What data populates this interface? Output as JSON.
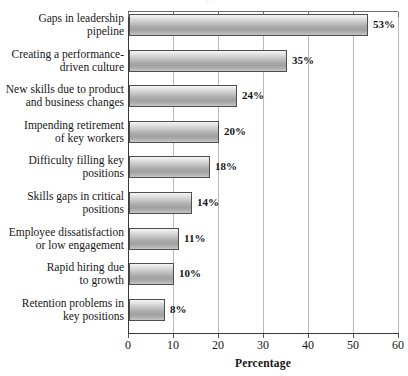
{
  "chart_data": {
    "type": "bar",
    "orientation": "horizontal",
    "title": "",
    "xlabel": "Percentage",
    "ylabel": "",
    "xlim": [
      0,
      60
    ],
    "xticks": [
      0,
      10,
      20,
      30,
      40,
      50,
      60
    ],
    "grid": true,
    "legend": null,
    "value_label_suffix": "%",
    "categories": [
      "Gaps in leadership pipeline",
      "Creating a performance-driven culture",
      "New skills due to product and business changes",
      "Impending retirement of key workers",
      "Difficulty filling key positions",
      "Skills gaps in critical positions",
      "Employee dissatisfaction or low engagement",
      "Rapid hiring due to growth",
      "Retention problems in key positions"
    ],
    "category_lines": [
      [
        "Gaps in leadership",
        "pipeline"
      ],
      [
        "Creating a performance-",
        "driven culture"
      ],
      [
        "New skills due to product",
        "and business changes"
      ],
      [
        "Impending retirement",
        "of key workers"
      ],
      [
        "Difficulty filling key",
        "positions"
      ],
      [
        "Skills gaps in critical",
        "positions"
      ],
      [
        "Employee dissatisfaction",
        "or low engagement"
      ],
      [
        "Rapid hiring due",
        "to growth"
      ],
      [
        "Retention problems in",
        "key positions"
      ]
    ],
    "values": [
      53,
      35,
      24,
      20,
      18,
      14,
      11,
      10,
      8
    ],
    "value_labels": [
      "53%",
      "35%",
      "24%",
      "20%",
      "18%",
      "14%",
      "11%",
      "10%",
      "8%"
    ],
    "colors": {
      "bar_top": "#f4f4f4",
      "bar_mid": "#a0a0a0",
      "bar_bottom": "#c8c8c8",
      "bar_border": "#4e4e4e",
      "gridline": "#b9b9b9",
      "axis": "#3a3a3a",
      "text": "#171717",
      "background": "#ffffff"
    }
  },
  "xaxis": {
    "title": "Percentage",
    "tick_labels": [
      "0",
      "10",
      "20",
      "30",
      "40",
      "50",
      "60"
    ]
  },
  "artifacts": {
    "top_edge_remnant": "· ·"
  }
}
